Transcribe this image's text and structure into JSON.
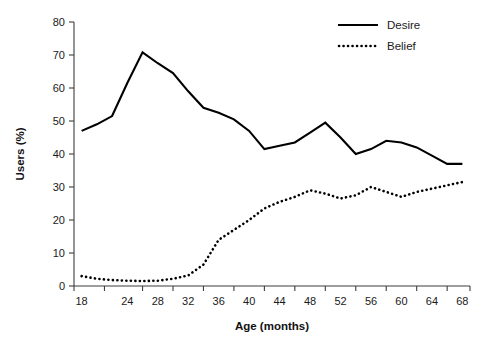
{
  "chart_data": {
    "type": "line",
    "title": "",
    "xlabel": "Age (months)",
    "ylabel": "Users (%)",
    "xlim": [
      17,
      69
    ],
    "ylim": [
      0,
      80
    ],
    "grid": false,
    "legend_position": "top-right",
    "x": [
      18,
      20,
      22,
      24,
      26,
      28,
      30,
      32,
      34,
      36,
      38,
      40,
      42,
      44,
      46,
      48,
      50,
      52,
      54,
      56,
      58,
      60,
      62,
      64,
      66,
      68
    ],
    "xtick_labels": [
      "18",
      "24",
      "28",
      "32",
      "36",
      "40",
      "44",
      "48",
      "52",
      "56",
      "60",
      "64",
      "68"
    ],
    "xtick_values": [
      18,
      24,
      28,
      32,
      36,
      40,
      44,
      48,
      52,
      56,
      60,
      64,
      68
    ],
    "ytick_labels": [
      "0",
      "10",
      "20",
      "30",
      "40",
      "50",
      "60",
      "70",
      "80"
    ],
    "ytick_values": [
      0,
      10,
      20,
      30,
      40,
      50,
      60,
      70,
      80
    ],
    "series": [
      {
        "name": "Desire",
        "style": "solid",
        "color": "#000000",
        "values": [
          47.0,
          49.0,
          51.5,
          61.5,
          70.8,
          67.5,
          64.5,
          59.0,
          54.0,
          52.5,
          50.5,
          47.0,
          41.5,
          42.5,
          43.5,
          46.5,
          49.5,
          45.0,
          40.0,
          41.5,
          44.0,
          43.5,
          42.0,
          39.5,
          37.0,
          37.0
        ]
      },
      {
        "name": "Belief",
        "style": "dotted",
        "color": "#000000",
        "values": [
          3.0,
          2.2,
          1.8,
          1.6,
          1.5,
          1.6,
          2.2,
          3.2,
          6.5,
          14.0,
          17.0,
          20.0,
          23.5,
          25.5,
          27.0,
          29.0,
          28.0,
          26.5,
          27.5,
          30.0,
          28.5,
          27.0,
          28.5,
          29.5,
          30.5,
          31.5
        ]
      }
    ]
  },
  "legend": {
    "items": [
      {
        "label": "Desire",
        "style": "solid"
      },
      {
        "label": "Belief",
        "style": "dotted"
      }
    ]
  },
  "axes": {
    "x_title": "Age (months)",
    "y_title": "Users (%)"
  }
}
